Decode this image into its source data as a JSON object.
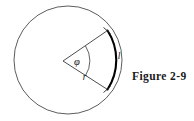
{
  "figure": {
    "caption": "Figure 2-9",
    "labels": {
      "arc_length": "l",
      "radius": "r",
      "angle": "φ"
    },
    "colors": {
      "background": "#ffffff",
      "circle_stroke": "#4a4a4a",
      "arc_stroke": "#000000",
      "radius_stroke": "#3a3a3a",
      "text": "#1a1a1a"
    },
    "geometry": {
      "circle_center_x": 68,
      "circle_center_y": 60,
      "circle_radius": 54,
      "vertex_x": 63,
      "vertex_y": 61,
      "upper_endpoint_x": 107,
      "upper_endpoint_y": 31,
      "lower_endpoint_x": 107,
      "lower_endpoint_y": 89
    }
  }
}
